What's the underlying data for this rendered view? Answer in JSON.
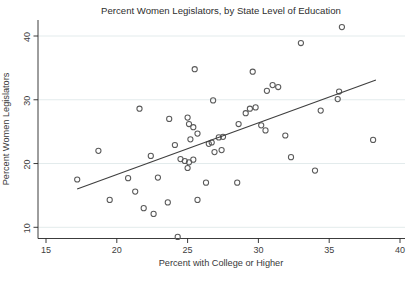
{
  "chart_data": {
    "type": "scatter",
    "title": "Percent Women Legislators, by State Level of Education",
    "xlabel": "Percent with College or Higher",
    "ylabel": "Percent Women Legislators",
    "xticks": [
      15,
      20,
      25,
      30,
      35,
      40
    ],
    "yticks": [
      10,
      20,
      30,
      40
    ],
    "xlim": [
      14.4,
      40.4
    ],
    "ylim": [
      8.0,
      42.5
    ],
    "grid": "horizontal-only",
    "legend": "none",
    "marker_style": "hollow-circle",
    "points": [
      [
        17.2,
        17.5
      ],
      [
        18.7,
        22.0
      ],
      [
        19.5,
        14.3
      ],
      [
        20.8,
        17.7
      ],
      [
        21.3,
        15.6
      ],
      [
        21.6,
        28.6
      ],
      [
        21.9,
        13.0
      ],
      [
        22.4,
        21.2
      ],
      [
        22.6,
        12.1
      ],
      [
        22.9,
        17.8
      ],
      [
        23.6,
        13.9
      ],
      [
        23.7,
        27.0
      ],
      [
        24.1,
        22.9
      ],
      [
        24.3,
        8.5
      ],
      [
        24.5,
        20.7
      ],
      [
        24.8,
        20.4
      ],
      [
        25.0,
        19.3
      ],
      [
        25.0,
        27.2
      ],
      [
        25.1,
        20.2
      ],
      [
        25.1,
        26.2
      ],
      [
        25.2,
        23.8
      ],
      [
        25.4,
        20.6
      ],
      [
        25.4,
        25.7
      ],
      [
        25.5,
        34.8
      ],
      [
        25.7,
        14.3
      ],
      [
        25.7,
        24.7
      ],
      [
        26.3,
        17.0
      ],
      [
        26.5,
        23.1
      ],
      [
        26.7,
        23.3
      ],
      [
        26.8,
        29.9
      ],
      [
        26.9,
        21.8
      ],
      [
        27.2,
        24.1
      ],
      [
        27.4,
        22.1
      ],
      [
        27.5,
        24.2
      ],
      [
        28.5,
        17.0
      ],
      [
        28.6,
        26.2
      ],
      [
        29.1,
        27.9
      ],
      [
        29.4,
        28.6
      ],
      [
        29.6,
        34.4
      ],
      [
        29.8,
        28.8
      ],
      [
        30.2,
        26.0
      ],
      [
        30.5,
        25.2
      ],
      [
        30.6,
        31.4
      ],
      [
        31.0,
        32.3
      ],
      [
        31.4,
        32.0
      ],
      [
        31.9,
        24.4
      ],
      [
        32.3,
        21.0
      ],
      [
        33.0,
        38.9
      ],
      [
        34.0,
        18.9
      ],
      [
        34.4,
        28.3
      ],
      [
        35.6,
        30.1
      ],
      [
        35.7,
        31.3
      ],
      [
        35.9,
        41.4
      ],
      [
        38.1,
        23.7
      ]
    ],
    "fit_line": {
      "x1": 17.2,
      "y1": 16.0,
      "x2": 38.3,
      "y2": 33.1
    },
    "colors": {
      "marker": "#5a5a5a",
      "fit_line": "#3f3f3f",
      "grid": "#e3ebec",
      "axis": "#262626",
      "text": "#383838",
      "background": "#ffffff"
    }
  }
}
